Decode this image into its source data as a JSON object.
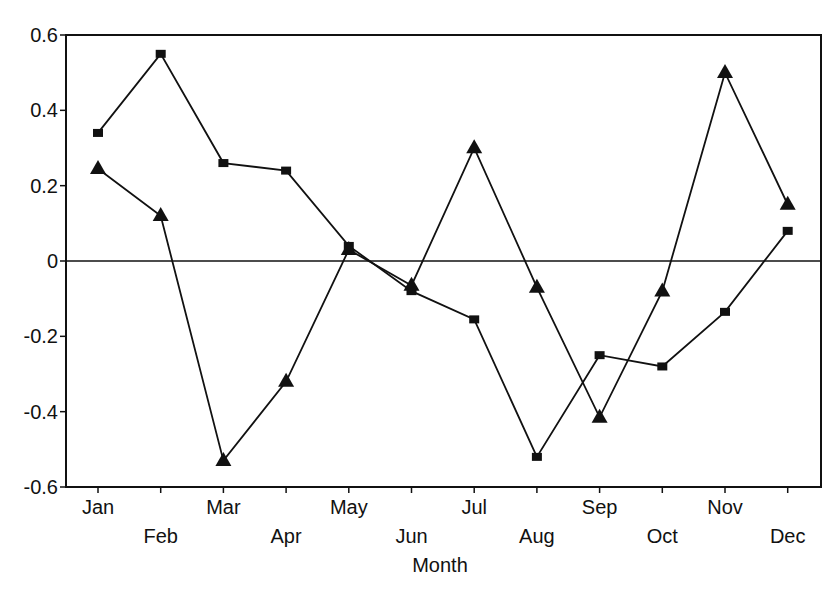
{
  "chart_data": {
    "type": "line",
    "title": "",
    "xlabel": "Month",
    "ylabel": "",
    "categories": [
      "Jan",
      "Feb",
      "Mar",
      "Apr",
      "May",
      "Jun",
      "Jul",
      "Aug",
      "Sep",
      "Oct",
      "Nov",
      "Dec"
    ],
    "series": [
      {
        "name": "square-marker series",
        "marker": "square",
        "values": [
          0.34,
          0.55,
          0.26,
          0.24,
          0.04,
          -0.08,
          -0.155,
          -0.52,
          -0.25,
          -0.28,
          -0.135,
          0.08
        ]
      },
      {
        "name": "triangle-marker series",
        "marker": "triangle",
        "values": [
          0.245,
          0.12,
          -0.53,
          -0.32,
          0.03,
          -0.065,
          0.3,
          -0.07,
          -0.415,
          -0.08,
          0.5,
          0.15
        ]
      }
    ],
    "ylim": [
      -0.6,
      0.6
    ],
    "yticks": [
      0.6,
      0.4,
      0.2,
      0,
      -0.2,
      -0.4,
      -0.6
    ],
    "ytick_labels": [
      "0.6",
      "0.4",
      "0.2",
      "0",
      "-0.2",
      "-0.4",
      "-0.6"
    ],
    "reference_line": 0,
    "grid": false,
    "legend": "none",
    "colors": {
      "line": "#111111",
      "frame": "#111111",
      "background": "#ffffff"
    }
  }
}
